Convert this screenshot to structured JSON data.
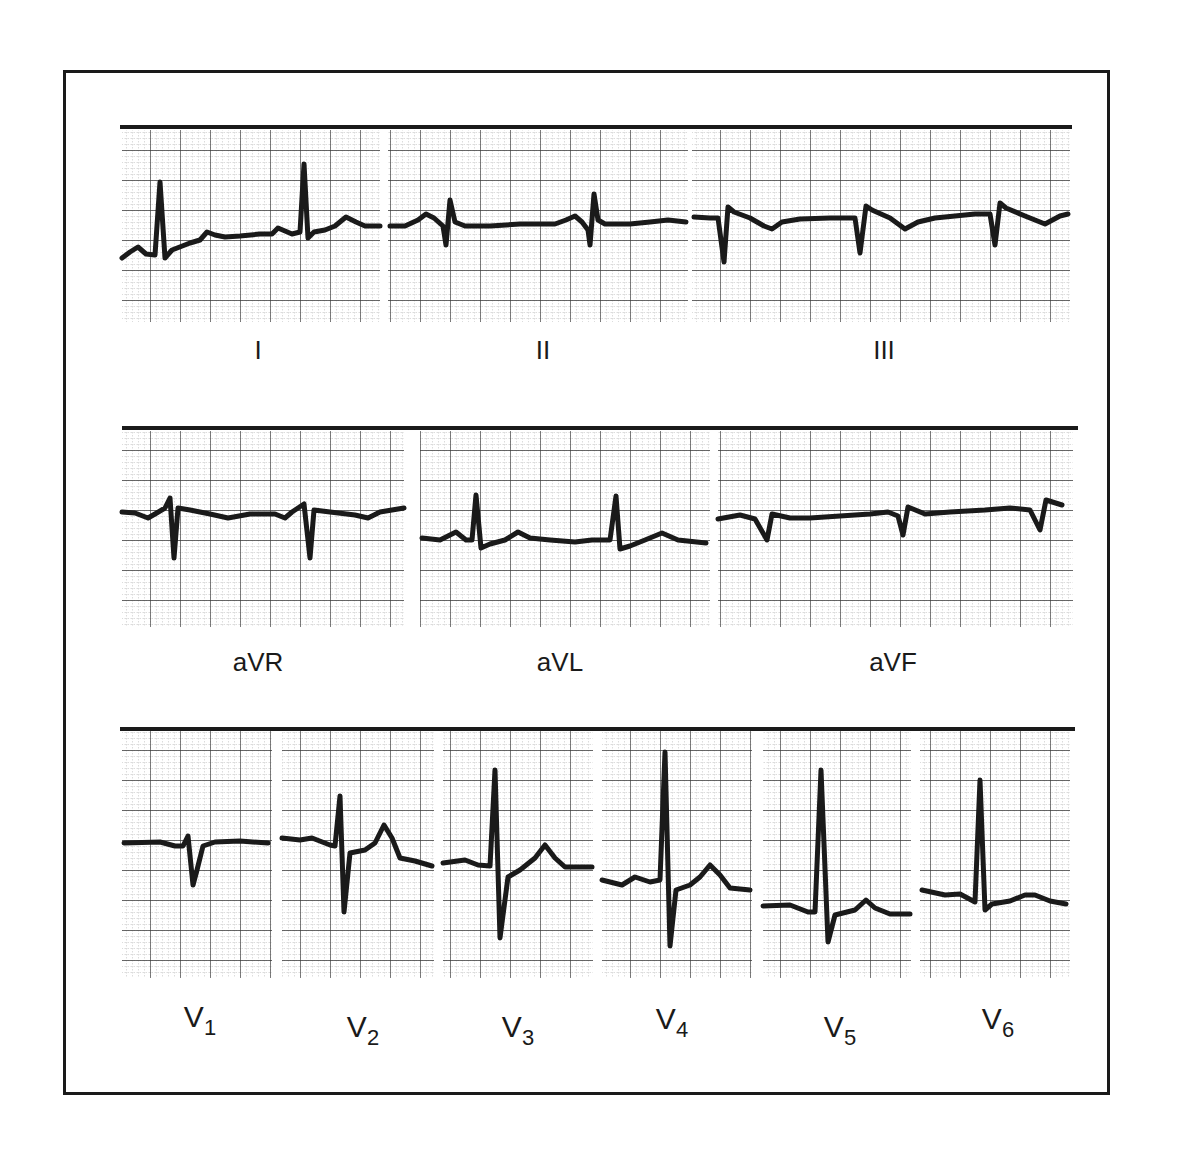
{
  "figure": {
    "colors": {
      "ink": "#1a1a1a",
      "grid_major": "#3a3a3a",
      "grid_minor": "#8a8a8a",
      "paper": "#ffffff"
    }
  },
  "rows": [
    {
      "name": "limb-leads",
      "top_rule": {
        "x1": 120,
        "x2": 1072,
        "y": 127
      },
      "leads": [
        {
          "id": "I",
          "label": "I",
          "label_x": 258,
          "label_y": 335,
          "panel": {
            "x": 122,
            "y": 130,
            "w": 258,
            "h": 192
          },
          "trace": "M122,258 L130,252 L138,247 L146,254 L155,255 L160,182 L165,258 L172,250 L190,243 L200,240 L207,232 L215,235 L225,237 L240,236 L260,234 L272,234 L278,228 L292,234 L300,232 L304,164 L308,238 L314,232 L325,230 L335,226 L346,217 L356,222 L365,226 L380,226"
        },
        {
          "id": "II",
          "label": "II",
          "label_x": 543,
          "label_y": 335,
          "panel": {
            "x": 388,
            "y": 130,
            "w": 300,
            "h": 192
          },
          "trace": "M390,226 L405,226 L418,220 L426,214 L434,218 L443,226 L446,245 L450,200 L455,222 L465,226 L490,226 L520,224 L555,224 L566,220 L575,216 L582,222 L588,230 L590,245 L594,194 L598,220 L605,224 L630,224 L650,222 L668,220 L686,222"
        },
        {
          "id": "III",
          "label": "III",
          "label_x": 884,
          "label_y": 335,
          "panel": {
            "x": 692,
            "y": 130,
            "w": 378,
            "h": 192
          },
          "trace": "M694,217 L710,218 L718,218 L724,262 L728,207 L734,212 L750,218 L764,226 L772,229 L782,222 L800,219 L830,218 L855,218 L860,253 L866,206 L872,210 L890,218 L905,229 L918,222 L935,218 L955,216 L975,214 L990,214 L995,245 L1000,203 L1006,208 L1025,216 L1045,224 L1060,216 L1068,214"
        }
      ]
    },
    {
      "name": "augmented-leads",
      "top_rule": {
        "x1": 122,
        "x2": 1078,
        "y": 428
      },
      "leads": [
        {
          "id": "aVR",
          "label": "aVR",
          "label_x": 258,
          "label_y": 647,
          "panel": {
            "x": 122,
            "y": 431,
            "w": 282,
            "h": 196
          },
          "trace": "M122,512 L135,513 L148,518 L155,514 L165,508 L170,498 L174,558 L178,508 L190,510 L210,514 L228,518 L250,514 L275,514 L285,518 L292,512 L304,504 L310,558 L314,510 L330,512 L355,515 L368,518 L380,512 L404,508"
        },
        {
          "id": "aVL",
          "label": "aVL",
          "label_x": 560,
          "label_y": 647,
          "panel": {
            "x": 420,
            "y": 431,
            "w": 290,
            "h": 196
          },
          "trace": "M422,538 L440,540 L456,532 L466,540 L472,540 L476,495 L481,548 L490,544 L505,540 L518,532 L530,538 L550,540 L575,542 L592,540 L602,540 L610,540 L616,496 L620,549 L630,546 L645,540 L662,533 L678,540 L706,543"
        },
        {
          "id": "aVF",
          "label": "aVF",
          "label_x": 893,
          "label_y": 647,
          "panel": {
            "x": 718,
            "y": 431,
            "w": 355,
            "h": 196
          },
          "trace": "M718,519 L740,515 L755,519 L767,540 L772,514 L790,518 L810,518 L840,516 L870,514 L888,512 L898,516 L903,535 L908,507 L925,514 L950,512 L985,510 L1010,508 L1030,510 L1040,530 L1046,500 L1062,505"
        }
      ]
    },
    {
      "name": "precordial-leads",
      "top_rule": {
        "x1": 120,
        "x2": 1075,
        "y": 729
      },
      "leads": [
        {
          "id": "V1",
          "label": "V",
          "sub": "1",
          "label_x": 200,
          "label_y": 1000,
          "panel": {
            "x": 122,
            "y": 731,
            "w": 150,
            "h": 247
          },
          "trace": "M124,843 L160,842 L175,846 L183,846 L188,836 L193,885 L197,870 L203,846 L215,842 L240,841 L268,843"
        },
        {
          "id": "V2",
          "label": "V",
          "sub": "2",
          "label_x": 363,
          "label_y": 1010,
          "panel": {
            "x": 282,
            "y": 731,
            "w": 152,
            "h": 247
          },
          "trace": "M282,838 L300,840 L312,838 L330,845 L335,846 L340,796 L344,912 L350,853 L365,850 L375,843 L384,825 L392,838 L400,858 L415,861 L432,866"
        },
        {
          "id": "V3",
          "label": "V",
          "sub": "3",
          "label_x": 518,
          "label_y": 1010,
          "panel": {
            "x": 443,
            "y": 731,
            "w": 150,
            "h": 247
          },
          "trace": "M443,863 L465,860 L478,865 L490,866 L495,770 L500,938 L508,877 L520,870 L535,858 L545,845 L555,858 L565,867 L592,867"
        },
        {
          "id": "V4",
          "label": "V",
          "sub": "4",
          "label_x": 672,
          "label_y": 1002,
          "panel": {
            "x": 602,
            "y": 731,
            "w": 150,
            "h": 247
          },
          "trace": "M602,880 L622,885 L635,877 L650,882 L660,880 L665,752 L670,946 L676,890 L690,885 L700,877 L710,865 L720,875 L730,888 L750,890"
        },
        {
          "id": "V5",
          "label": "V",
          "sub": "5",
          "label_x": 840,
          "label_y": 1010,
          "panel": {
            "x": 763,
            "y": 731,
            "w": 148,
            "h": 247
          },
          "trace": "M763,906 L790,905 L808,912 L815,912 L821,770 L828,942 L835,915 L855,910 L866,900 L875,908 L890,914 L910,914"
        },
        {
          "id": "V6",
          "label": "V",
          "sub": "6",
          "label_x": 998,
          "label_y": 1002,
          "panel": {
            "x": 920,
            "y": 731,
            "w": 150,
            "h": 247
          },
          "trace": "M922,890 L945,895 L960,894 L975,902 L980,780 L985,910 L992,904 L1010,901 L1025,895 L1035,895 L1050,901 L1066,904"
        }
      ]
    }
  ]
}
